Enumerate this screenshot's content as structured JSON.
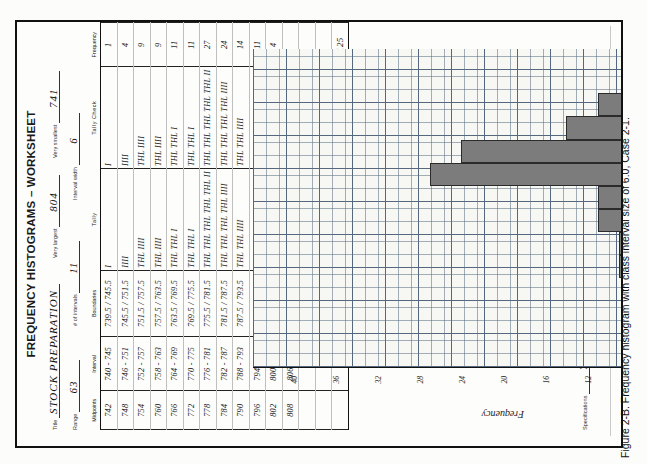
{
  "caption": "Figure 2-B. Frequency histogram with class interval size of 6.0, Case 2-1.",
  "worksheet": {
    "title": "FREQUENCY HISTOGRAMS – WORKSHEET",
    "fields": {
      "title_label": "Title",
      "title_value": "STOCK PREPARATION",
      "very_largest_label": "Very largest",
      "very_largest_value": "804",
      "very_smallest_label": "Very smallest",
      "very_smallest_value": "741",
      "range_label": "Range",
      "range_value": "63",
      "num_intervals_label": "# of intervals",
      "num_intervals_value": "11",
      "interval_width_label": "Interval width",
      "interval_width_value": "6",
      "specifications_label": "Specifications",
      "specifications_value": "730 to 790 GM"
    },
    "columns": [
      "Midpoints",
      "Interval",
      "Boundaries",
      "Tally",
      "Tally Check",
      "Frequency"
    ],
    "rows": [
      {
        "midpoint": "742",
        "interval": "740 - 745",
        "boundaries": "739.5 / 745.5",
        "tally": "I",
        "check": "I",
        "frequency": "1"
      },
      {
        "midpoint": "748",
        "interval": "746 - 751",
        "boundaries": "745.5 / 751.5",
        "tally": "IIII",
        "check": "IIII",
        "frequency": "4"
      },
      {
        "midpoint": "754",
        "interval": "752 - 757",
        "boundaries": "751.5 / 757.5",
        "tally": "THL IIII",
        "check": "THL IIII",
        "frequency": "9"
      },
      {
        "midpoint": "760",
        "interval": "758 - 763",
        "boundaries": "757.5 / 763.5",
        "tally": "THL IIII",
        "check": "THL IIII",
        "frequency": "9"
      },
      {
        "midpoint": "766",
        "interval": "764 - 769",
        "boundaries": "763.5 / 769.5",
        "tally": "THL THL I",
        "check": "THL THL I",
        "frequency": "11"
      },
      {
        "midpoint": "772",
        "interval": "770 - 775",
        "boundaries": "769.5 / 775.5",
        "tally": "THL THL I",
        "check": "THL THL I",
        "frequency": "11"
      },
      {
        "midpoint": "778",
        "interval": "776 - 781",
        "boundaries": "775.5 / 781.5",
        "tally": "THL THL THL THL THL II",
        "check": "THL THL THL THL THL II",
        "frequency": "27"
      },
      {
        "midpoint": "784",
        "interval": "782 - 787",
        "boundaries": "781.5 / 787.5",
        "tally": "THL THL THL THL IIII",
        "check": "THL THL THL THL IIII",
        "frequency": "24"
      },
      {
        "midpoint": "790",
        "interval": "788 - 793",
        "boundaries": "787.5 / 793.5",
        "tally": "THL THL IIII",
        "check": "THL THL IIII",
        "frequency": "14"
      },
      {
        "midpoint": "796",
        "interval": "794 - 799",
        "boundaries": "793.5 / 799.5",
        "tally": "THL THL I",
        "check": "THL THL I",
        "frequency": "11"
      },
      {
        "midpoint": "802",
        "interval": "800 - 805",
        "boundaries": "799.5 / 805.5",
        "tally": "IIII",
        "check": "IIII",
        "frequency": "4"
      },
      {
        "midpoint": "808",
        "interval": "806 - 811",
        "boundaries": "805.5 / 811.5",
        "tally": "",
        "check": "",
        "frequency": ""
      },
      {
        "midpoint": "",
        "interval": "",
        "boundaries": "",
        "tally": "",
        "check": "",
        "frequency": ""
      },
      {
        "midpoint": "",
        "interval": "",
        "boundaries": "",
        "tally": "",
        "check": "",
        "frequency": ""
      }
    ],
    "total_label": "Total",
    "total_value": "125"
  },
  "chart_data": {
    "type": "bar",
    "title": "",
    "xlabel": "PREP. WEIGHT IN GRAMS",
    "ylabel": "Frequency",
    "categories": [
      "730",
      "736",
      "742",
      "748",
      "754",
      "760",
      "766",
      "772",
      "778",
      "784",
      "790",
      "796",
      "802",
      "808"
    ],
    "values": [
      0,
      0,
      1,
      4,
      9,
      9,
      11,
      11,
      27,
      24,
      14,
      11,
      4,
      0
    ],
    "ylim": [
      0,
      44
    ],
    "yticks": [
      "4",
      "8",
      "12",
      "16",
      "20",
      "24",
      "28",
      "32",
      "36",
      "40"
    ],
    "grid": true,
    "annotations": [
      {
        "label": "Lower Spec.",
        "value": 730
      },
      {
        "label": "Upper Spec.",
        "value": 790
      }
    ]
  }
}
